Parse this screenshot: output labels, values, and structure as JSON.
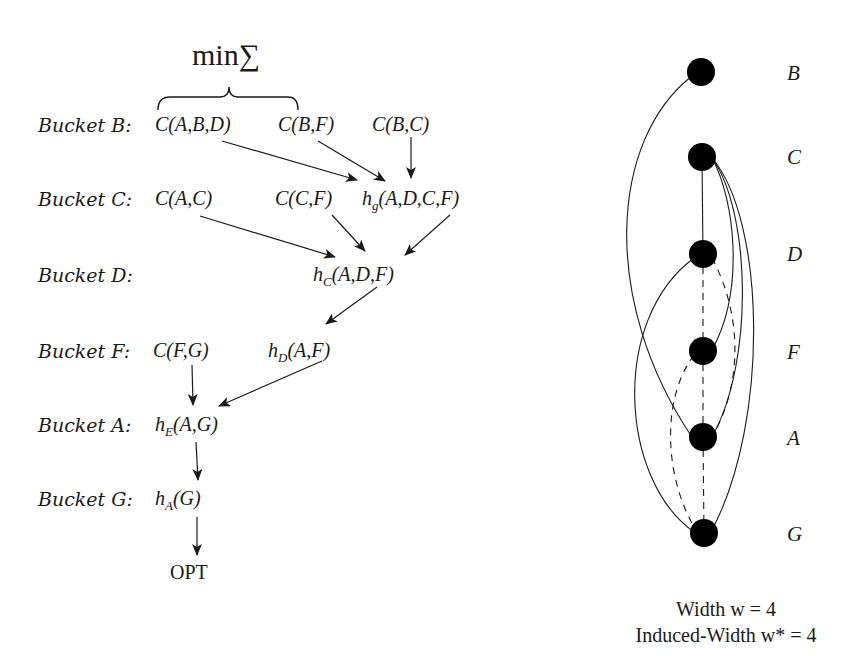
{
  "bucket_elimination": {
    "operator_label": "min∑",
    "buckets": [
      {
        "label": "Bucket B:",
        "functions": [
          "C(A,B,D)",
          "C(B,F)",
          "C(B,C)"
        ]
      },
      {
        "label": "Bucket C:",
        "functions": [
          "C(A,C)",
          "C(C,F)",
          "h_g(A,D,C,F)"
        ]
      },
      {
        "label": "Bucket D:",
        "functions": [
          "h_C(A,D,F)"
        ]
      },
      {
        "label": "Bucket F:",
        "functions": [
          "C(F,G)",
          "h_D(A,F)"
        ]
      },
      {
        "label": "Bucket A:",
        "functions": [
          "h_E(A,G)"
        ]
      },
      {
        "label": "Bucket G:",
        "functions": [
          "h_A(G)"
        ]
      }
    ],
    "result": "OPT",
    "fn": {
      "cabd": "C(A,B,D)",
      "cbf": "C(B,F)",
      "cbc": "C(B,C)",
      "cac": "C(A,C)",
      "ccf": "C(C,F)",
      "hg_h": "h",
      "hg_sub": "g",
      "hg_args": "(A,D,C,F)",
      "hc_h": "h",
      "hc_sub": "C",
      "hc_args": "(A,D,F)",
      "cfg": "C(F,G)",
      "hd_h": "h",
      "hd_sub": "D",
      "hd_args": "(A,F)",
      "he_h": "h",
      "he_sub": "E",
      "he_args": "(A,G)",
      "ha_h": "h",
      "ha_sub": "A",
      "ha_args": "(G)"
    }
  },
  "graph": {
    "nodes": [
      {
        "id": "B",
        "label": "B"
      },
      {
        "id": "C",
        "label": "C"
      },
      {
        "id": "D",
        "label": "D"
      },
      {
        "id": "F",
        "label": "F"
      },
      {
        "id": "A",
        "label": "A"
      },
      {
        "id": "G",
        "label": "G"
      }
    ],
    "solid_edges": [
      [
        "B",
        "A"
      ],
      [
        "C",
        "D"
      ],
      [
        "C",
        "F"
      ],
      [
        "C",
        "A"
      ],
      [
        "C",
        "G"
      ],
      [
        "D",
        "G"
      ],
      [
        "F",
        "G"
      ]
    ],
    "dashed_edges": [
      [
        "D",
        "F"
      ],
      [
        "D",
        "A"
      ],
      [
        "F",
        "A"
      ],
      [
        "F",
        "G"
      ],
      [
        "A",
        "G"
      ]
    ],
    "caption_line1": "Width w = 4",
    "caption_line2": "Induced-Width w* = 4"
  }
}
